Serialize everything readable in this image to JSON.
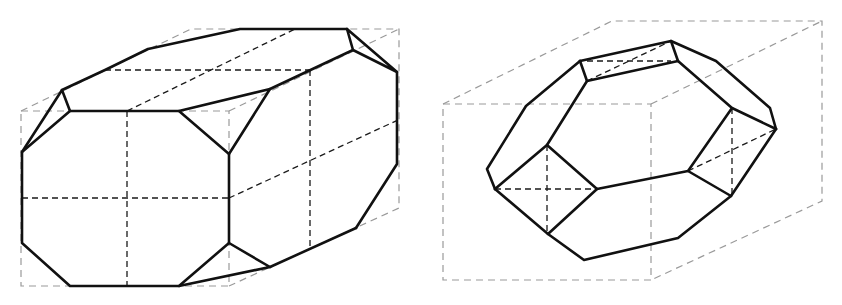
{
  "figure": {
    "colors": {
      "background": "#ffffff",
      "visible_edge": "#111111",
      "hidden_edge": "#1a1a1a",
      "bounding_box": "#9a9a9a"
    },
    "panels": [
      {
        "id": "left",
        "label": "",
        "shape": "elongated octagonal prism with truncated corners",
        "front_face_sides": 8,
        "corner_triangles": 4
      },
      {
        "id": "right",
        "label": "",
        "shape": "truncated polyhedron with hexagonal front faces",
        "front_face_sides": 6
      }
    ]
  }
}
